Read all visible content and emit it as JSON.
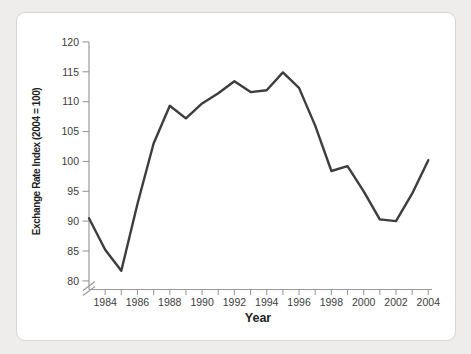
{
  "chart_data": {
    "type": "line",
    "title": "",
    "xlabel": "Year",
    "ylabel": "Exchange Rate Index (2004 = 100)",
    "x": [
      1983,
      1984,
      1985,
      1986,
      1987,
      1988,
      1989,
      1990,
      1991,
      1992,
      1993,
      1994,
      1995,
      1996,
      1997,
      1998,
      1999,
      2000,
      2001,
      2002,
      2003,
      2004
    ],
    "values": [
      90.5,
      85.2,
      81.7,
      92.9,
      103.0,
      109.3,
      107.2,
      109.7,
      111.4,
      113.4,
      111.6,
      111.9,
      114.9,
      112.3,
      106.0,
      98.4,
      99.2,
      95.0,
      90.3,
      90.0,
      94.6,
      100.2
    ],
    "xlim": [
      1983,
      2004
    ],
    "ylim": [
      80,
      120
    ],
    "yticks": [
      80,
      85,
      90,
      95,
      100,
      105,
      110,
      115,
      120
    ],
    "xtick_labels": [
      1984,
      1986,
      1988,
      1990,
      1992,
      1994,
      1996,
      1998,
      2000,
      2002,
      2004
    ],
    "xtick_minor_every_year": true,
    "grid": false,
    "legend": null,
    "axis_break_bottom_left": true,
    "line_color": "#3d3d3d",
    "axis_color": "#9a9a9a",
    "label_color": "#3c3c3c",
    "panel_bg": "#ffffff",
    "page_bg": "#efedec"
  }
}
